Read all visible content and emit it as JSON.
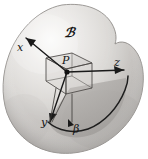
{
  "figure": {
    "kind": "mathematical-diagram",
    "canvas": {
      "width": 148,
      "height": 159,
      "background": "#ffffff"
    },
    "labels": {
      "body": "ℬ",
      "point": "P",
      "axis_x": "x",
      "axis_y": "y",
      "axis_z": "z",
      "curve": "β"
    },
    "colors": {
      "background": "#ffffff",
      "body_light": "#f2f1f0",
      "body_mid": "#cfcdcb",
      "body_dark": "#9b9895",
      "body_outline": "#8e8b88",
      "swept_region": "#a9a6a3",
      "box_stroke": "#4a4744",
      "axis_stroke": "#1a1a1a",
      "label_color": "#141414",
      "point_fill": "#111111"
    },
    "elements": {
      "body_outline_name": "body-blob",
      "shaded_region_name": "swept-region",
      "box_name": "tangent-box",
      "point_name": "point-p-marker",
      "curve_name": "curve-beta"
    }
  }
}
